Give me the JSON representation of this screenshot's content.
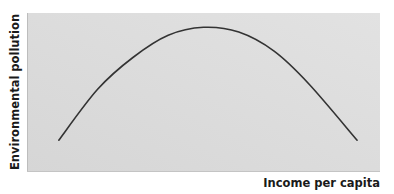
{
  "chart_data": {
    "type": "line",
    "title": "",
    "xlabel": "Income per capita",
    "ylabel": "Environmental pollution",
    "xlim": [
      0,
      1
    ],
    "ylim": [
      0,
      1
    ],
    "grid": false,
    "legend": null,
    "x_ticks": [],
    "y_ticks": [],
    "series": [
      {
        "name": "Environmental Kuznets curve",
        "shape": "inverted-U",
        "x": [
          0.09,
          0.2,
          0.3,
          0.4,
          0.5,
          0.6,
          0.7,
          0.8,
          0.935
        ],
        "y": [
          0.2,
          0.52,
          0.72,
          0.86,
          0.91,
          0.88,
          0.76,
          0.55,
          0.2
        ]
      }
    ],
    "colors": {
      "panel_background": "#dadada",
      "curve": "#333333",
      "text": "#1a1a1a"
    }
  }
}
